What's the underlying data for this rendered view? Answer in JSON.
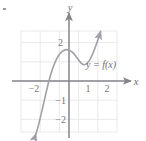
{
  "figure": {
    "background_color": "#ffffff",
    "grid_color": "#e3e3e6",
    "axis_color": "#84848a",
    "curve_color": "#a0a0a6",
    "label_color": "#6e6e72"
  },
  "axes": {
    "x_axis_label": "x",
    "y_axis_label": "y",
    "x_ticks": [
      {
        "value": -2,
        "label": "−2"
      },
      {
        "value": 1,
        "label": "1"
      },
      {
        "value": 2,
        "label": "2"
      }
    ],
    "y_ticks": [
      {
        "value": 2,
        "label": "2"
      },
      {
        "value": -1,
        "label": "−1"
      },
      {
        "value": -2,
        "label": "−2"
      }
    ],
    "x_range": [
      -2.55,
      2.55
    ],
    "y_range": [
      -3.2,
      2.6
    ],
    "grid": true,
    "grid_step": 1,
    "origin_px": {
      "x": 69,
      "y": 81
    },
    "unit_px": 19.2
  },
  "curve": {
    "label": "y = f(x)",
    "type": "cubic",
    "arrow_start": true,
    "arrow_end": true,
    "points": [
      {
        "x": -1.72,
        "y": -2.75
      },
      {
        "x": -1.6,
        "y": -2.2
      },
      {
        "x": -1.45,
        "y": -1.45
      },
      {
        "x": -1.3,
        "y": -0.7
      },
      {
        "x": -1.18,
        "y": 0.0
      },
      {
        "x": -1.05,
        "y": 0.62
      },
      {
        "x": -0.9,
        "y": 1.1
      },
      {
        "x": -0.72,
        "y": 1.42
      },
      {
        "x": -0.55,
        "y": 1.57
      },
      {
        "x": -0.38,
        "y": 1.6
      },
      {
        "x": -0.2,
        "y": 1.52
      },
      {
        "x": 0.0,
        "y": 1.35
      },
      {
        "x": 0.2,
        "y": 1.18
      },
      {
        "x": 0.42,
        "y": 1.06
      },
      {
        "x": 0.6,
        "y": 1.04
      },
      {
        "x": 0.78,
        "y": 1.12
      },
      {
        "x": 0.95,
        "y": 1.32
      },
      {
        "x": 1.12,
        "y": 1.62
      },
      {
        "x": 1.3,
        "y": 2.0
      },
      {
        "x": 1.45,
        "y": 2.38
      },
      {
        "x": 1.55,
        "y": 2.62
      }
    ]
  },
  "marks": {
    "corner_speck": "decorative-speck"
  }
}
